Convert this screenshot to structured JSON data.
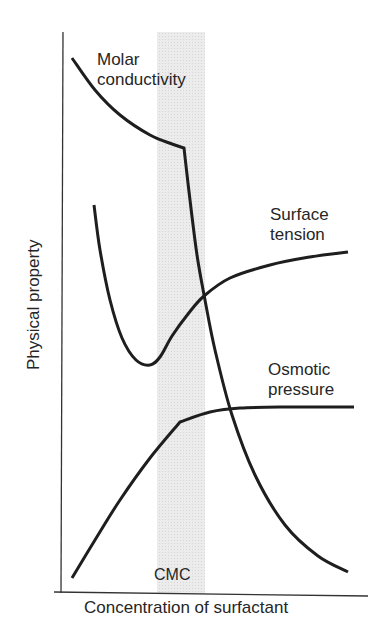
{
  "chart_data": {
    "type": "line",
    "title": "",
    "xlabel": "Concentration of surfactant",
    "ylabel": "Physical property",
    "axis_ticks": "none (qualitative axes)",
    "annotations": [
      {
        "text": "CMC",
        "kind": "shaded vertical band",
        "x_range_px": [
          157,
          205
        ],
        "color": "#e6e6e6"
      }
    ],
    "grid": false,
    "legend": "none; curves labelled directly",
    "series": [
      {
        "name": "Molar conductivity",
        "label_lines": [
          "Molar",
          "conductivity"
        ],
        "description": "Decreases gradually below CMC, then drops sharply above CMC",
        "points_px": [
          [
            72,
            58
          ],
          [
            95,
            90
          ],
          [
            120,
            115
          ],
          [
            150,
            135
          ],
          [
            172,
            144
          ],
          [
            184,
            148
          ],
          [
            190,
            200
          ],
          [
            197,
            255
          ],
          [
            205,
            300
          ],
          [
            215,
            350
          ],
          [
            232,
            415
          ],
          [
            255,
            475
          ],
          [
            285,
            525
          ],
          [
            318,
            556
          ],
          [
            348,
            572
          ]
        ]
      },
      {
        "name": "Surface tension",
        "label_lines": [
          "Surface",
          "tension"
        ],
        "description": "Falls steeply to a minimum just below CMC, then rises and levels off",
        "points_px": [
          [
            94,
            205
          ],
          [
            100,
            250
          ],
          [
            110,
            300
          ],
          [
            122,
            338
          ],
          [
            136,
            360
          ],
          [
            150,
            365
          ],
          [
            160,
            357
          ],
          [
            172,
            336
          ],
          [
            188,
            314
          ],
          [
            204,
            296
          ],
          [
            230,
            278
          ],
          [
            270,
            265
          ],
          [
            310,
            257
          ],
          [
            348,
            252
          ]
        ]
      },
      {
        "name": "Osmotic pressure",
        "label_lines": [
          "Osmotic",
          "pressure"
        ],
        "description": "Rises roughly linearly until CMC, then plateaus",
        "points_px": [
          [
            72,
            578
          ],
          [
            95,
            540
          ],
          [
            120,
            500
          ],
          [
            150,
            458
          ],
          [
            180,
            422
          ],
          [
            210,
            412
          ],
          [
            240,
            408
          ],
          [
            290,
            407
          ],
          [
            354,
            407
          ]
        ]
      }
    ]
  },
  "labels": {
    "molar_line1": "Molar",
    "molar_line2": "conductivity",
    "surface_line1": "Surface",
    "surface_line2": "tension",
    "osmotic_line1": "Osmotic",
    "osmotic_line2": "pressure",
    "cmc": "CMC",
    "xlabel": "Concentration of surfactant",
    "ylabel": "Physical property"
  }
}
